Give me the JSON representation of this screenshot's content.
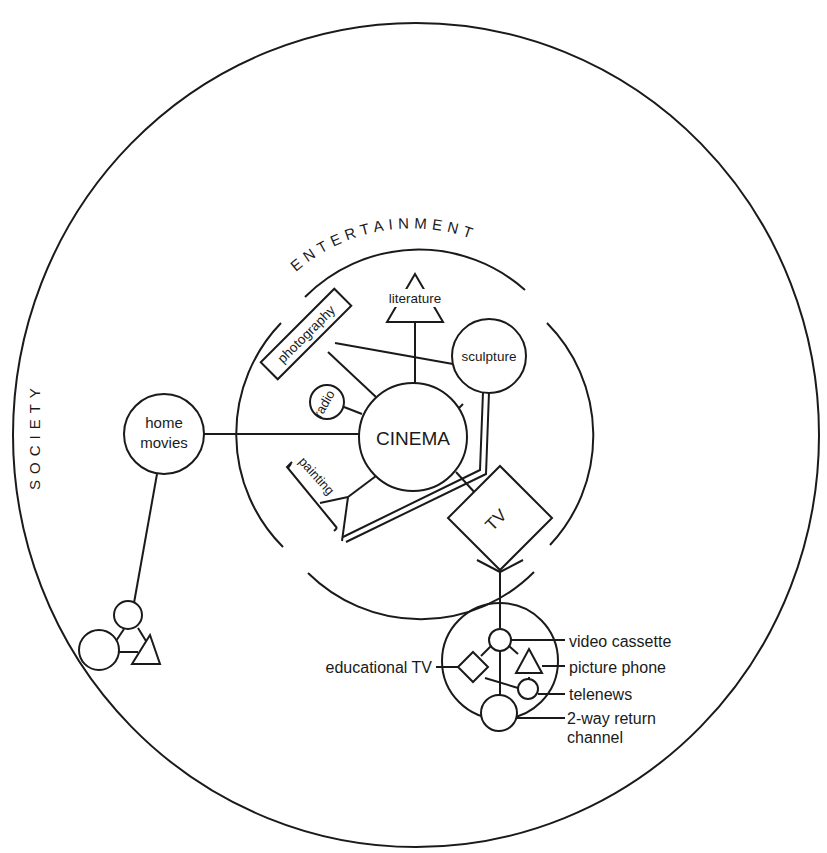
{
  "diagram": {
    "colors": {
      "ink": "#1a1a1a",
      "background": "#ffffff"
    },
    "outer_ring": {
      "label": "SOCIETY"
    },
    "inner_ring": {
      "label": "ENTERTAINMENT"
    },
    "nodes": {
      "cinema": {
        "label": "CINEMA",
        "shape": "circle"
      },
      "literature": {
        "label": "literature",
        "shape": "triangle"
      },
      "photography": {
        "label": "photography",
        "shape": "rectangle"
      },
      "sculpture": {
        "label": "sculpture",
        "shape": "circle"
      },
      "radio": {
        "label": "radio",
        "shape": "circle"
      },
      "painting": {
        "label": "painting",
        "shape": "bracket"
      },
      "tv": {
        "label": "TV",
        "shape": "diamond"
      },
      "home_movies": {
        "label_line1": "home",
        "label_line2": "movies",
        "shape": "circle"
      }
    },
    "tv_cluster": {
      "video_cassette": "video cassette",
      "picture_phone": "picture phone",
      "telenews": "telenews",
      "two_way_line1": "2-way return",
      "two_way_line2": "channel",
      "educational_tv": "educational TV"
    }
  }
}
